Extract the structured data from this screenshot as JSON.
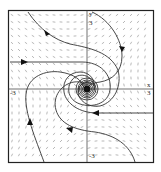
{
  "figure": {
    "type": "phase-portrait",
    "axes": {
      "x_label": "x",
      "y_label": "y",
      "x_min_label": "-3",
      "x_max_label": "3",
      "y_min_label": "-3",
      "y_max_label": "3"
    },
    "equilibrium": {
      "x": 0,
      "y": 0,
      "kind": "stable spiral"
    },
    "colors": {
      "frame": "#222222",
      "trajectory": "#333333",
      "field": "#777777",
      "background": "#ffffff"
    }
  }
}
